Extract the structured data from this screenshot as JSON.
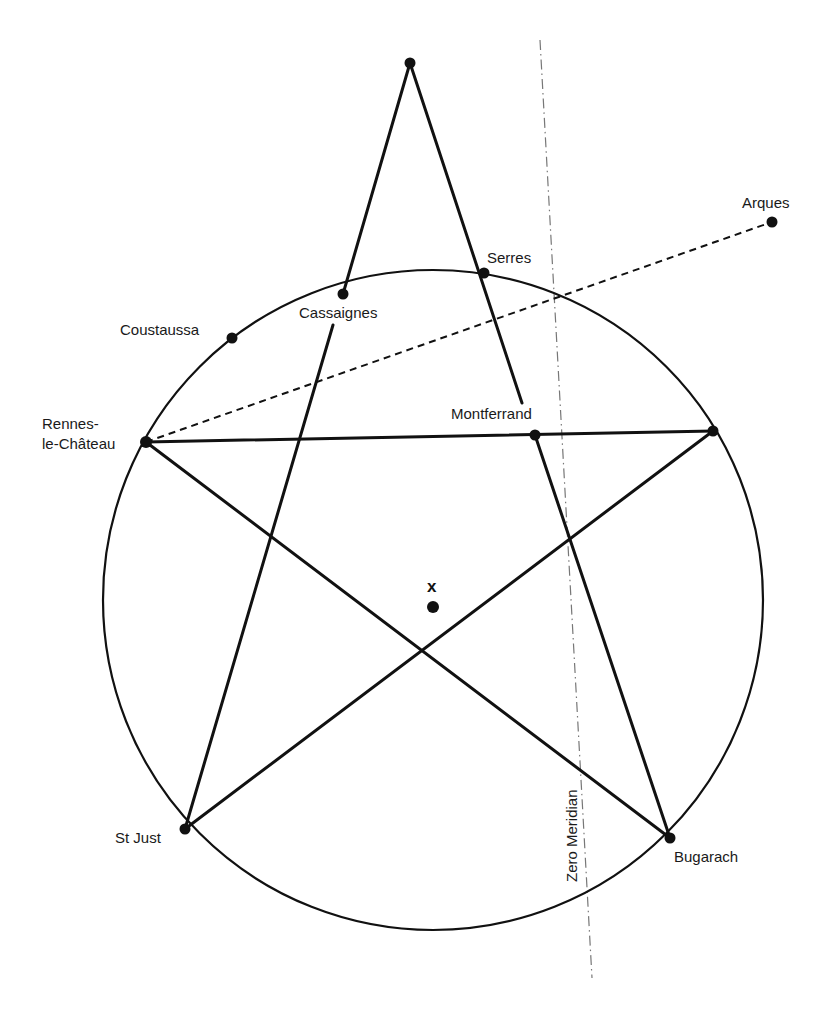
{
  "diagram": {
    "colors": {
      "ink": "#111111",
      "background": "#ffffff",
      "label": "#1a1a1a"
    },
    "circle": {
      "cx": 433,
      "cy": 600,
      "r": 330
    },
    "points": {
      "apex": {
        "x": 410,
        "y": 63
      },
      "rennes": {
        "x": 146,
        "y": 442
      },
      "right_vertex": {
        "x": 713,
        "y": 431
      },
      "st_just": {
        "x": 185,
        "y": 829
      },
      "bugarach": {
        "x": 670,
        "y": 838
      },
      "serres": {
        "x": 484,
        "y": 273
      },
      "cassaignes": {
        "x": 343,
        "y": 294
      },
      "coustaussa": {
        "x": 232,
        "y": 338
      },
      "montferrand": {
        "x": 535,
        "y": 435
      },
      "arques": {
        "x": 772,
        "y": 222
      },
      "x_point": {
        "x": 433,
        "y": 607
      }
    },
    "labels": {
      "serres": "Serres",
      "cassaignes": "Cassaignes",
      "coustaussa": "Coustaussa",
      "rennes_line1": "Rennes-",
      "rennes_line2": "le-Château",
      "montferrand": "Montferrand",
      "arques": "Arques",
      "x_mark": "x",
      "st_just": "St Just",
      "bugarach": "Bugarach",
      "meridian": "Zero Meridian"
    }
  }
}
